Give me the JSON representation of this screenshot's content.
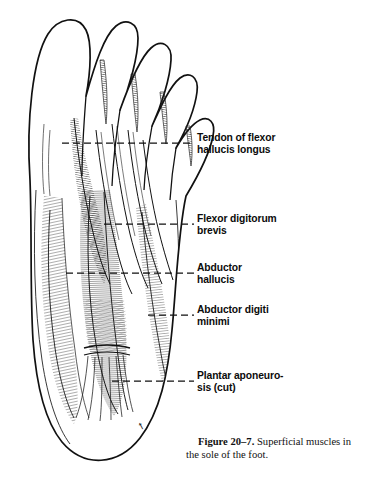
{
  "figure": {
    "number": "Figure 20–7.",
    "caption_text": "Superficial muscles in the sole of the foot.",
    "background_color": "#ffffff",
    "ink_color": "#111111"
  },
  "labels": [
    {
      "id": "tendon-flexor-hallucis-longus",
      "text": "Tendon of flexor\nhallucis longus",
      "x": 197,
      "y": 138
    },
    {
      "id": "flexor-digitorum-brevis",
      "text": "Flexor digitorum\nbrevis",
      "x": 197,
      "y": 219
    },
    {
      "id": "abductor-hallucis",
      "text": "Abductor\nhallucis",
      "x": 197,
      "y": 268
    },
    {
      "id": "abductor-digiti-minimi",
      "text": "Abductor digiti\nminimi",
      "x": 197,
      "y": 310
    },
    {
      "id": "plantar-aponeurosis-cut",
      "text": "Plantar aponeuro-\nsis (cut)",
      "x": 197,
      "y": 369
    }
  ],
  "leader_lines": [
    {
      "id": "leader-tendon-flexor-hallucis-longus",
      "y": 143,
      "x_start": 62,
      "x_end": 194
    },
    {
      "id": "leader-flexor-digitorum-brevis",
      "y": 224,
      "x_start": 104,
      "x_end": 194
    },
    {
      "id": "leader-abductor-hallucis",
      "y": 273,
      "x_start": 66,
      "x_end": 194
    },
    {
      "id": "leader-abductor-digiti-minimi",
      "y": 315,
      "x_start": 148,
      "x_end": 194
    },
    {
      "id": "leader-plantar-aponeurosis",
      "y": 381,
      "x_start": 112,
      "x_end": 194
    }
  ],
  "artist_mark": {
    "id": "artist-signature",
    "text": "",
    "x": 143,
    "y": 434
  }
}
